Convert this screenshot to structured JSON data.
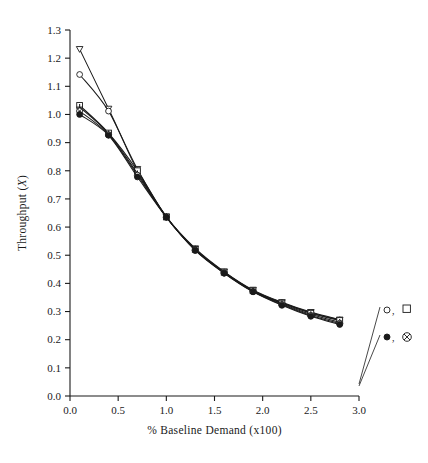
{
  "chart_data": {
    "type": "line",
    "title": "",
    "xlabel": "% Baseline Demand (x100)",
    "ylabel_prefix": "Throughput (",
    "ylabel_italic": "X",
    "ylabel_suffix": ")",
    "xlim": [
      0.0,
      3.0
    ],
    "ylim": [
      0.0,
      1.3
    ],
    "grid": false,
    "xticks": [
      "0.0",
      "0.5",
      "1.0",
      "1.5",
      "2.0",
      "2.5",
      "3.0"
    ],
    "xtick_values": [
      0.0,
      0.5,
      1.0,
      1.5,
      2.0,
      2.5,
      3.0
    ],
    "yticks": [
      "0.0",
      "0.1",
      "0.2",
      "0.3",
      "0.4",
      "0.5",
      "0.6",
      "0.7",
      "0.8",
      "0.9",
      "1.0",
      "1.1",
      "1.2",
      "1.3"
    ],
    "ytick_values": [
      0.0,
      0.1,
      0.2,
      0.3,
      0.4,
      0.5,
      0.6,
      0.7,
      0.8,
      0.9,
      1.0,
      1.1,
      1.2,
      1.3
    ],
    "x": [
      0.1,
      0.4,
      0.7,
      1.0,
      1.3,
      1.6,
      1.9,
      2.2,
      2.5,
      2.8
    ],
    "series": [
      {
        "name": "open-triangle",
        "marker": "triangle-open",
        "values": [
          1.232,
          1.02,
          0.806,
          0.637,
          0.524,
          0.442,
          0.377,
          0.333,
          0.298,
          0.271
        ]
      },
      {
        "name": "open-circle",
        "marker": "circle-open",
        "values": [
          1.142,
          1.012,
          0.8,
          0.636,
          0.522,
          0.44,
          0.375,
          0.331,
          0.296,
          0.27
        ]
      },
      {
        "name": "open-square",
        "marker": "square-open",
        "values": [
          1.032,
          0.934,
          0.8,
          0.636,
          0.521,
          0.44,
          0.374,
          0.33,
          0.294,
          0.268
        ]
      },
      {
        "name": "plus-cross",
        "marker": "plus",
        "values": [
          1.026,
          0.932,
          0.79,
          0.636,
          0.52,
          0.438,
          0.372,
          0.328,
          0.29,
          0.262
        ]
      },
      {
        "name": "circled-x",
        "marker": "circle-x",
        "values": [
          1.012,
          0.928,
          0.784,
          0.635,
          0.518,
          0.437,
          0.371,
          0.325,
          0.286,
          0.258
        ]
      },
      {
        "name": "filled-circle",
        "marker": "circle-filled",
        "values": [
          1.0,
          0.926,
          0.778,
          0.635,
          0.517,
          0.436,
          0.37,
          0.322,
          0.283,
          0.254
        ]
      }
    ],
    "annotations": [
      {
        "name": "legend-upper",
        "text": "○,",
        "symbol": "square-open",
        "target_x": 3.0,
        "target_y": 0.25
      },
      {
        "name": "legend-lower",
        "text": "●,",
        "symbol": "circle-x",
        "target_x": 3.0,
        "target_y": 0.243
      }
    ],
    "legend_position": "right-outside"
  },
  "legend": {
    "upper_label": ",",
    "lower_label": ","
  }
}
